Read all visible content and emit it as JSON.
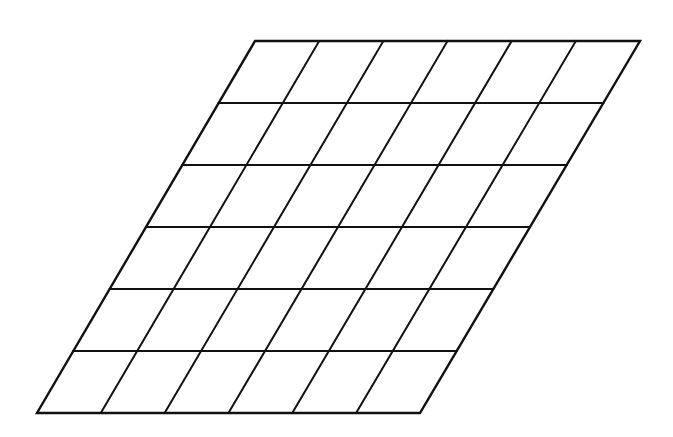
{
  "figure": {
    "kind": "parallelogram-grid-diagram",
    "background_color": "#ffffff",
    "line_color": "#111111",
    "fill_color": "#ffffff",
    "line_width": 2,
    "outline_width": 2.4,
    "canvas": {
      "width": 673,
      "height": 437
    }
  },
  "chart_data": {
    "type": "diagram",
    "title": "",
    "subtitle": "",
    "xlabel": "",
    "ylabel": "",
    "grid": true,
    "legend": "none",
    "shape": "parallelogram",
    "rows": 6,
    "columns": 6,
    "cell_count": 36,
    "corners": {
      "top_left": [
        255,
        41
      ],
      "top_right": [
        640,
        41
      ],
      "bottom_right": [
        420,
        413
      ],
      "bottom_left": [
        37,
        413
      ]
    },
    "edge_lengths_px": {
      "top": 385,
      "bottom": 383,
      "left_run_dx": -218,
      "left_run_dy": 372
    },
    "row_line_y": [
      41,
      103,
      165,
      227,
      290,
      352,
      413
    ],
    "column_spacing_top_px": 64.2,
    "row_spacing_px": 62,
    "shear_per_row_px": -36.3,
    "annotations": [],
    "tick_labels": {
      "x": [],
      "y": []
    }
  }
}
